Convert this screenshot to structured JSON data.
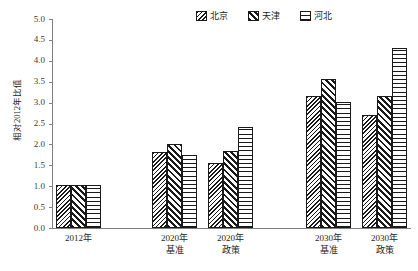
{
  "chart_data": {
    "type": "bar",
    "title": "",
    "subtitle": "",
    "xlabel": "",
    "ylabel": "相对2012年比值",
    "ylim": [
      0.0,
      5.0
    ],
    "ytick_step": 0.5,
    "grid": false,
    "legend_position": "top-right",
    "categories": [
      "2012年",
      "2020年基准",
      "2020年政策",
      "2030年基准",
      "2030年政策"
    ],
    "category_lines": [
      [
        "2012年",
        ""
      ],
      [
        "2020年",
        "基准"
      ],
      [
        "2020年",
        "政策"
      ],
      [
        "2030年",
        "基准"
      ],
      [
        "2030年",
        "政策"
      ]
    ],
    "series": [
      {
        "name": "北京",
        "pattern": "dense-diagonal-crosshatch",
        "values": [
          1.02,
          1.82,
          1.55,
          3.16,
          2.7
        ]
      },
      {
        "name": "天津",
        "pattern": "wide-diagonal-stripe",
        "values": [
          1.02,
          2.0,
          1.84,
          3.56,
          3.16
        ]
      },
      {
        "name": "河北",
        "pattern": "horizontal-stripe",
        "values": [
          1.02,
          1.74,
          2.42,
          3.02,
          4.3
        ]
      }
    ],
    "ytick_labels": [
      "5.0",
      "4.5",
      "4.0",
      "3.5",
      "3.0",
      "2.5",
      "2.0",
      "1.5",
      "1.0",
      "0.5",
      "0.0"
    ],
    "ytick_values": [
      5.0,
      4.5,
      4.0,
      3.5,
      3.0,
      2.5,
      2.0,
      1.5,
      1.0,
      0.5,
      0.0
    ],
    "colors": {
      "bar_outline": "#1a1a1a",
      "bar_fill": "#ffffff",
      "hatch": "#1a1a1a",
      "axis": "#808080",
      "text": "#262626",
      "background": "#ffffff"
    }
  },
  "legend": {
    "entries": [
      {
        "label": "北京",
        "pattern": "dense-diagonal-crosshatch"
      },
      {
        "label": "天津",
        "pattern": "wide-diagonal-stripe"
      },
      {
        "label": "河北",
        "pattern": "horizontal-stripe"
      }
    ]
  },
  "axis": {
    "y_title": "相对2012年比值"
  }
}
